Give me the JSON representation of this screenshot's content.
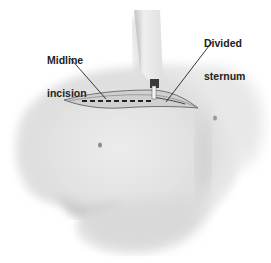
{
  "figure": {
    "type": "medical-illustration",
    "labels": [
      {
        "id": "midline",
        "line1": "Midline",
        "line2": "incision"
      },
      {
        "id": "sternum",
        "line1": "Divided",
        "line2": "sternum"
      }
    ],
    "colors": {
      "background": "#ffffff",
      "skin_light": "#f2f2f2",
      "skin_mid": "#dcdcdc",
      "skin_shadow": "#bdbdbd",
      "line": "#2a2a2a",
      "instrument": "#e6e6e6"
    }
  }
}
